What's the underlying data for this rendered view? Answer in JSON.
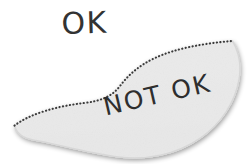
{
  "figure": {
    "type": "annotated-region-diagram",
    "background_color": "#ffffff",
    "region": {
      "name": "not-ok-region",
      "fill_color": "#e9e9e9",
      "fill_color_edge": "#dedede",
      "shape": "leaf-crescent",
      "boundary": {
        "dotted_edge_color": "#3a3a3a",
        "dotted_edge_description": "upper S-curve boundary drawn as a dotted line",
        "smooth_edge_color": "#dcdcdc",
        "smooth_edge_description": "lower boundary drawn as a soft smooth edge"
      }
    }
  },
  "labels": {
    "outside": {
      "text": "OK",
      "color": "#333333",
      "position": "above-left, outside the shaded region",
      "rotation_deg": -1.5
    },
    "inside": {
      "text": "NOT OK",
      "color": "#2e2e2e",
      "position": "inside the shaded region, lower area",
      "rotation_deg": -13
    }
  }
}
